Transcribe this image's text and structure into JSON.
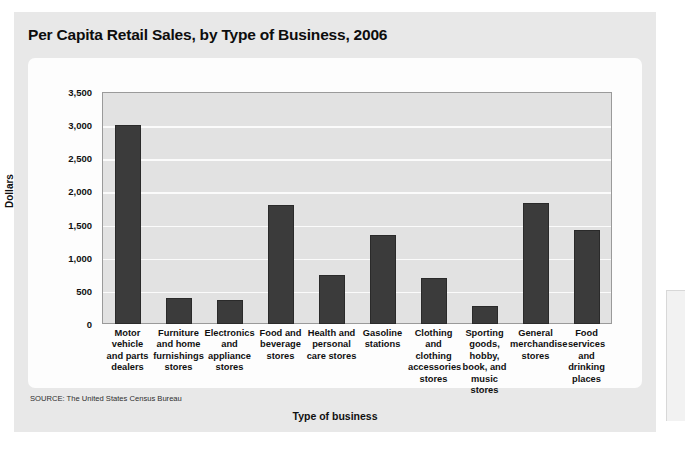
{
  "figure": {
    "title": "Per Capita Retail Sales, by Type of Business, 2006",
    "source": "SOURCE: The United States Census Bureau"
  },
  "colors": {
    "bar_fill": "#3b3b3b",
    "plot_background": "#e2e2e2",
    "gridline": "#fbfbfb",
    "panel_background": "#e8e8e8",
    "card_background": "#fdfdfd"
  },
  "chart_data": {
    "type": "bar",
    "title": "Per Capita Retail Sales, by Type of Business, 2006",
    "xlabel": "Type of business",
    "ylabel": "Dollars",
    "ylim": [
      0,
      3500
    ],
    "ytick_step": 500,
    "yticks": [
      0,
      500,
      1000,
      1500,
      2000,
      2500,
      3000,
      3500
    ],
    "ytick_labels": [
      "0",
      "500",
      "1,000",
      "1,500",
      "2,000",
      "2,500",
      "3,000",
      "3,500"
    ],
    "grid": true,
    "legend": false,
    "categories": [
      "Motor vehicle and parts dealers",
      "Furniture and home furnishings stores",
      "Electronics and appliance stores",
      "Food and beverage stores",
      "Health and personal care stores",
      "Gasoline stations",
      "Clothing and clothing accessories stores",
      "Sporting goods, hobby, book, and music stores",
      "General merchandise stores",
      "Food services and drinking places"
    ],
    "category_lines": [
      [
        "Motor",
        "vehicle",
        "and parts",
        "dealers"
      ],
      [
        "Furniture",
        "and home",
        "furnishings",
        "stores"
      ],
      [
        "Electronics",
        "and",
        "appliance",
        "stores"
      ],
      [
        "Food and",
        "beverage",
        "stores"
      ],
      [
        "Health and",
        "personal",
        "care stores"
      ],
      [
        "Gasoline",
        "stations"
      ],
      [
        "Clothing",
        "and",
        "clothing",
        "accessories",
        "stores"
      ],
      [
        "Sporting",
        "goods,",
        "hobby,",
        "book, and",
        "music",
        "stores"
      ],
      [
        "General",
        "merchandise",
        "stores"
      ],
      [
        "Food",
        "services",
        "and",
        "drinking",
        "places"
      ]
    ],
    "values": [
      3000,
      390,
      355,
      1795,
      740,
      1340,
      695,
      270,
      1830,
      1420
    ]
  }
}
